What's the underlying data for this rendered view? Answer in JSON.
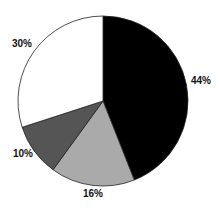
{
  "chart_data": {
    "type": "pie",
    "title": "",
    "start_angle_deg": 0,
    "direction": "clockwise",
    "legend": "none",
    "categories": [
      "Slice A",
      "Slice B",
      "Slice C",
      "Slice D"
    ],
    "values": [
      44,
      16,
      10,
      30
    ],
    "labels": [
      "44%",
      "16%",
      "10%",
      "30%"
    ],
    "colors": [
      "#000000",
      "#aaaaaa",
      "#555555",
      "#ffffff"
    ]
  },
  "layout": {
    "cx": 103,
    "cy": 101,
    "r": 85
  }
}
